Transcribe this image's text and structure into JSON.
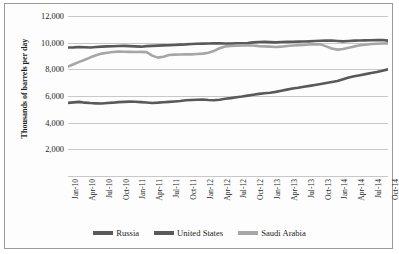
{
  "chart_data": {
    "type": "line",
    "title": "",
    "xlabel": "",
    "ylabel": "Thousands of barrels per day",
    "ylim": [
      0,
      12000
    ],
    "yticks": [
      12000,
      10000,
      8000,
      6000,
      4000,
      2000,
      0
    ],
    "ytick_labels": [
      "12,000",
      "10,000",
      "8,000",
      "6,000",
      "4,000",
      "2,000",
      ""
    ],
    "grid": true,
    "legend_position": "bottom",
    "x_tick_labels": [
      "Jan-10",
      "Apr-10",
      "Jul-10",
      "Oct-10",
      "Jan-11",
      "Apr-11",
      "Jul-11",
      "Oct-11",
      "Jan-12",
      "Apr-12",
      "Jul-12",
      "Oct-12",
      "Jan-13",
      "Apr-13",
      "Jul-13",
      "Oct-13",
      "Jan-14",
      "Apr-14",
      "Jul-14",
      "Oct-14"
    ],
    "x": [
      "Jan-10",
      "Feb-10",
      "Mar-10",
      "Apr-10",
      "May-10",
      "Jun-10",
      "Jul-10",
      "Aug-10",
      "Sep-10",
      "Oct-10",
      "Nov-10",
      "Dec-10",
      "Jan-11",
      "Feb-11",
      "Mar-11",
      "Apr-11",
      "May-11",
      "Jun-11",
      "Jul-11",
      "Aug-11",
      "Sep-11",
      "Oct-11",
      "Nov-11",
      "Dec-11",
      "Jan-12",
      "Feb-12",
      "Mar-12",
      "Apr-12",
      "May-12",
      "Jun-12",
      "Jul-12",
      "Aug-12",
      "Sep-12",
      "Oct-12",
      "Nov-12",
      "Dec-12",
      "Jan-13",
      "Feb-13",
      "Mar-13",
      "Apr-13",
      "May-13",
      "Jun-13",
      "Jul-13",
      "Aug-13",
      "Sep-13",
      "Oct-13",
      "Nov-13",
      "Dec-13",
      "Jan-14",
      "Feb-14",
      "Mar-14",
      "Apr-14",
      "May-14",
      "Jun-14",
      "Jul-14",
      "Aug-14",
      "Sep-14",
      "Oct-14"
    ],
    "series": [
      {
        "name": "Russia",
        "color": "#595959",
        "values": [
          9640,
          9650,
          9680,
          9660,
          9640,
          9670,
          9700,
          9720,
          9730,
          9750,
          9760,
          9740,
          9720,
          9700,
          9740,
          9760,
          9780,
          9800,
          9810,
          9830,
          9850,
          9870,
          9900,
          9920,
          9930,
          9940,
          9950,
          9960,
          9940,
          9930,
          9950,
          9960,
          9980,
          10020,
          10050,
          10060,
          10040,
          10020,
          10050,
          10060,
          10070,
          10080,
          10090,
          10100,
          10120,
          10140,
          10150,
          10160,
          10130,
          10100,
          10130,
          10150,
          10160,
          10170,
          10180,
          10190,
          10200,
          10150
        ]
      },
      {
        "name": "United States",
        "color": "#595959",
        "values": [
          5480,
          5520,
          5560,
          5500,
          5470,
          5450,
          5440,
          5470,
          5500,
          5540,
          5560,
          5580,
          5570,
          5540,
          5510,
          5480,
          5500,
          5530,
          5560,
          5590,
          5620,
          5680,
          5700,
          5720,
          5740,
          5700,
          5680,
          5720,
          5790,
          5840,
          5900,
          5960,
          6030,
          6100,
          6160,
          6200,
          6250,
          6310,
          6400,
          6480,
          6560,
          6620,
          6700,
          6760,
          6830,
          6900,
          6980,
          7050,
          7120,
          7250,
          7380,
          7480,
          7560,
          7640,
          7720,
          7800,
          7900,
          8000
        ]
      },
      {
        "name": "Saudi Arabia",
        "color": "#a6a6a6",
        "values": [
          8200,
          8380,
          8560,
          8720,
          8900,
          9050,
          9180,
          9250,
          9300,
          9330,
          9320,
          9310,
          9300,
          9310,
          9290,
          9030,
          8880,
          8950,
          9080,
          9100,
          9110,
          9130,
          9120,
          9150,
          9180,
          9250,
          9380,
          9580,
          9720,
          9760,
          9780,
          9800,
          9810,
          9790,
          9740,
          9720,
          9700,
          9680,
          9700,
          9750,
          9790,
          9810,
          9830,
          9860,
          9880,
          9870,
          9720,
          9560,
          9480,
          9520,
          9620,
          9720,
          9800,
          9850,
          9900,
          9920,
          9940,
          9950
        ]
      }
    ]
  },
  "legend": {
    "items": [
      {
        "label": "Russia",
        "color": "#595959"
      },
      {
        "label": "United States",
        "color": "#595959"
      },
      {
        "label": "Saudi Arabia",
        "color": "#a6a6a6"
      }
    ]
  }
}
